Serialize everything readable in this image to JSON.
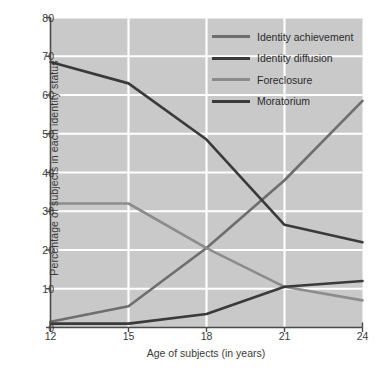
{
  "chart_data": {
    "type": "line",
    "title": "",
    "xlabel": "Age of subjects (in years)",
    "ylabel": "Percentage of subjects in each identity status",
    "x": [
      12,
      15,
      18,
      21,
      24
    ],
    "xticklabels": [
      "12",
      "15",
      "18",
      "21",
      "24"
    ],
    "yticklabels": [
      "0",
      "10",
      "20",
      "30",
      "40",
      "50",
      "60",
      "70",
      "80"
    ],
    "xlim": [
      12,
      24
    ],
    "ylim": [
      0,
      80
    ],
    "grid": "both",
    "legend_position": "top-right-inside",
    "series": [
      {
        "name": "Identity achievement",
        "color": "#6e6e6e",
        "values": [
          1.5,
          5.5,
          20.5,
          38.0,
          58.5
        ]
      },
      {
        "name": "Identity diffusion",
        "color": "#3a3a3a",
        "values": [
          68.5,
          63.0,
          48.5,
          26.5,
          22.0
        ]
      },
      {
        "name": "Foreclosure",
        "color": "#8c8c8c",
        "values": [
          32.0,
          32.0,
          20.5,
          10.5,
          7.0
        ]
      },
      {
        "name": "Moratorium",
        "color": "#3a3a3a",
        "values": [
          1.0,
          1.0,
          3.5,
          10.5,
          12.0
        ]
      }
    ],
    "colors": {
      "plot_background": "#c9c9c9",
      "gridline": "#ffffff",
      "axis": "#4a4a4a",
      "text": "#2b2b2b"
    }
  }
}
